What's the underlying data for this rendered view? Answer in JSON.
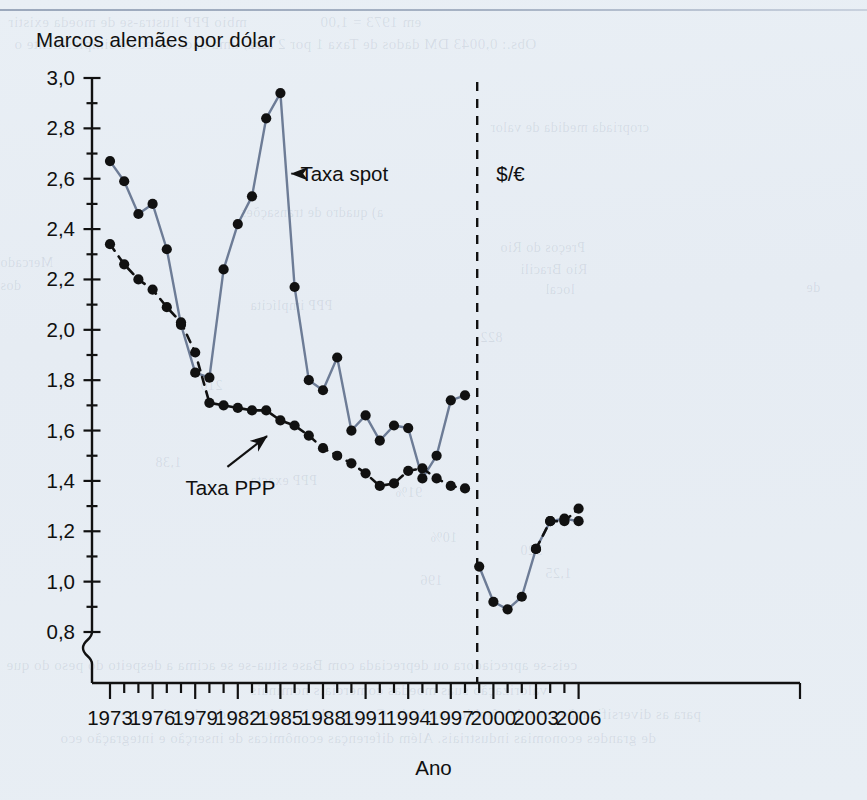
{
  "figure": {
    "title": "Marcos alemães por dólar",
    "xlabel": "Ano",
    "regime_label": "$/€",
    "annotations": {
      "spot": "Taxa spot",
      "ppp": "Taxa PPP"
    }
  },
  "colors": {
    "background": "#e8eef4",
    "spot_line": "#6d7c96",
    "ppp_line": "#111111",
    "marker": "#111111",
    "axis": "#111111",
    "regime_divider": "#111111"
  },
  "chart_data": {
    "type": "line",
    "title": "Marcos alemães por dólar",
    "xlabel": "Ano",
    "ylabel": "Marcos alemães por dólar",
    "xlim": [
      1972,
      2007
    ],
    "ylim": [
      0.8,
      3.0
    ],
    "ytick_step": 0.2,
    "yminor_step": 0.1,
    "axis_break_below": 0.8,
    "grid": false,
    "legend": "annotated inline (arrows)",
    "xticks_major": [
      1973,
      1976,
      1979,
      1982,
      1985,
      1988,
      1991,
      1994,
      1997,
      2000,
      2003,
      2006
    ],
    "xticks_all_years": true,
    "ytick_labels": [
      "3,0",
      "2,8",
      "2,6",
      "2,4",
      "2,2",
      "2,0",
      "1,8",
      "1,6",
      "1,4",
      "1,2",
      "1,0",
      "0,8"
    ],
    "annotations": [
      {
        "text": "Taxa spot",
        "x": 1987.4,
        "y": 2.62,
        "points_to_x": 1985.5,
        "points_to_y": 2.62
      },
      {
        "text": "Taxa PPP",
        "x": 1980.0,
        "y": 1.4,
        "points_to_x": 1984.2,
        "points_to_y": 1.61
      },
      {
        "text": "$/€",
        "x": 2000.2,
        "y": 2.62
      }
    ],
    "regime_divider_x": 1999.0,
    "series": [
      {
        "name": "Taxa spot",
        "style": "solid",
        "color": "#6d7c96",
        "x": [
          1973,
          1974,
          1975,
          1976,
          1977,
          1978,
          1979,
          1980,
          1981,
          1982,
          1983,
          1984,
          1985,
          1986,
          1987,
          1988,
          1989,
          1990,
          1991,
          1992,
          1993,
          1994,
          1995,
          1996,
          1997,
          1998
        ],
        "values": [
          2.67,
          2.59,
          2.46,
          2.5,
          2.32,
          2.02,
          1.83,
          1.81,
          2.24,
          2.42,
          2.53,
          2.84,
          2.94,
          2.17,
          1.8,
          1.76,
          1.89,
          1.6,
          1.66,
          1.56,
          1.62,
          1.61,
          1.41,
          1.5,
          1.72,
          1.74
        ]
      },
      {
        "name": "Taxa PPP",
        "style": "dashed",
        "color": "#111111",
        "x": [
          1973,
          1974,
          1975,
          1976,
          1977,
          1978,
          1979,
          1980,
          1981,
          1982,
          1983,
          1984,
          1985,
          1986,
          1987,
          1988,
          1989,
          1990,
          1991,
          1992,
          1993,
          1994,
          1995,
          1996,
          1997,
          1998
        ],
        "values": [
          2.34,
          2.26,
          2.2,
          2.16,
          2.09,
          2.03,
          1.91,
          1.71,
          1.7,
          1.69,
          1.68,
          1.68,
          1.64,
          1.62,
          1.58,
          1.53,
          1.5,
          1.47,
          1.43,
          1.38,
          1.39,
          1.44,
          1.45,
          1.41,
          1.38,
          1.37
        ]
      },
      {
        "name": "$/€ (spot, euro era)",
        "style": "solid",
        "color": "#6d7c96",
        "x": [
          1999,
          2000,
          2001,
          2002,
          2003,
          2004,
          2005,
          2006
        ],
        "values": [
          1.06,
          0.92,
          0.89,
          0.94,
          1.13,
          1.24,
          1.25,
          1.24
        ]
      },
      {
        "name": "$/€ (PPP, euro era)",
        "style": "dashed",
        "color": "#111111",
        "x": [
          2003,
          2004,
          2005,
          2006
        ],
        "values": [
          1.13,
          1.24,
          1.24,
          1.29
        ]
      }
    ]
  },
  "bleed_text": [
    {
      "text": "mbio PPP ilustra-se de moeda existir",
      "x": 8,
      "y": 14,
      "size": 15
    },
    {
      "text": "ara, uma dada moeda é simplesmente o",
      "x": 14,
      "y": 36,
      "size": 15
    },
    {
      "text": "em 1973 = 1,00",
      "x": 320,
      "y": 14,
      "size": 15
    },
    {
      "text": "Obs.: 0,0043 DM dados de Taxa 1 por 2 ano",
      "x": 250,
      "y": 36,
      "size": 15
    },
    {
      "text": "cropriada medida de valor",
      "x": 490,
      "y": 120,
      "size": 14
    },
    {
      "text": "a) quadro de transações",
      "x": 240,
      "y": 205,
      "size": 14
    },
    {
      "text": "Preços do Rio",
      "x": 500,
      "y": 240,
      "size": 14
    },
    {
      "text": "Rio Bracili",
      "x": 520,
      "y": 262,
      "size": 14
    },
    {
      "text": "local",
      "x": 545,
      "y": 282,
      "size": 14
    },
    {
      "text": "PPP implícita",
      "x": 250,
      "y": 298,
      "size": 14
    },
    {
      "text": "Mercado",
      "x": 0,
      "y": 255,
      "size": 14
    },
    {
      "text": "dos",
      "x": 0,
      "y": 278,
      "size": 14
    },
    {
      "text": "de",
      "x": 806,
      "y": 280,
      "size": 14
    },
    {
      "text": "822",
      "x": 480,
      "y": 330,
      "size": 14
    },
    {
      "text": "210",
      "x": 200,
      "y": 378,
      "size": 14
    },
    {
      "text": "1,38",
      "x": 155,
      "y": 455,
      "size": 14
    },
    {
      "text": "PPP exacta",
      "x": 250,
      "y": 473,
      "size": 14
    },
    {
      "text": "91%",
      "x": 395,
      "y": 485,
      "size": 14
    },
    {
      "text": "320",
      "x": 520,
      "y": 543,
      "size": 14
    },
    {
      "text": "10%",
      "x": 430,
      "y": 530,
      "size": 14
    },
    {
      "text": "1,25",
      "x": 545,
      "y": 566,
      "size": 14
    },
    {
      "text": "196",
      "x": 420,
      "y": 573,
      "size": 14
    },
    {
      "text": "ceis-se apreciadora ou depreciada com Base situa-se se acima a despeito do peso do que",
      "x": 6,
      "y": 657,
      "size": 15
    },
    {
      "text": "valorização suas moedas comerciais nominais",
      "x": 250,
      "y": 682,
      "size": 15
    },
    {
      "text": "para as diversificação taxa de câmbio nominais. Custos relativos de entrada, de país entre",
      "x": 120,
      "y": 706,
      "size": 15
    },
    {
      "text": "de grandes economias industriais. Além   diferenças econômicas de inserção e integração eco",
      "x": 60,
      "y": 730,
      "size": 15
    }
  ]
}
